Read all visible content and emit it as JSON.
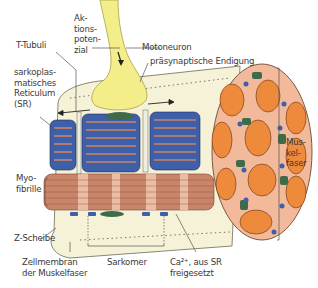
{
  "figure": {
    "labels": {
      "aktionspotenzial": "Ak-\ntions-\npoten-\nzial",
      "t_tubuli": "T-Tubuli",
      "motoneuron": "Motoneuron",
      "praesynaptisch": "präsynaptische Endigung",
      "sr": "sarkoplas-\nmatisches\nReticulum\n(SR)",
      "muskelfaser": "Mus-\nkel-\nfaser",
      "myofibrille": "Myo-\nfibrille",
      "z_scheibe": "Z-Scheibe",
      "zellmembran": "Zellmembran\nder Muskelfaser",
      "sarkomer": "Sarkomer",
      "calcium": "Ca²⁺, aus SR\nfreigesetzt"
    },
    "colors": {
      "neuron": "#f3ee8a",
      "membrane": "#f6f2d8",
      "sr": "#3f5fa8",
      "myofibril": "#c9856a",
      "myofibril_band": "#f0c8b0",
      "cross_section_bg": "#f2b99a",
      "fibril_orange": "#ee8a3c",
      "mito_green": "#3f6b4a"
    }
  }
}
